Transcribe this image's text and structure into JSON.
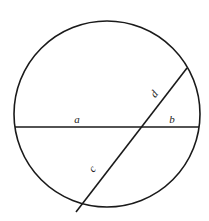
{
  "diagram": {
    "type": "circle-intersecting-chords",
    "circle": {
      "cx": 107,
      "cy": 114,
      "r": 93
    },
    "chords": [
      {
        "id": "horizontal",
        "x1": 15,
        "y1": 127,
        "x2": 199,
        "y2": 127
      },
      {
        "id": "diagonal",
        "x1": 76,
        "y1": 212,
        "x2": 187,
        "y2": 68
      }
    ],
    "intersection": {
      "x": 139,
      "y": 127
    },
    "labels": [
      {
        "text": "a",
        "x": 77,
        "y": 123,
        "rotate": 0
      },
      {
        "text": "b",
        "x": 172,
        "y": 123,
        "rotate": 0
      },
      {
        "text": "c",
        "x": 95,
        "y": 171,
        "rotate": -52
      },
      {
        "text": "d",
        "x": 157,
        "y": 96,
        "rotate": -52
      }
    ],
    "colors": {
      "stroke": "#1a1a1a",
      "background": "#ffffff"
    }
  }
}
